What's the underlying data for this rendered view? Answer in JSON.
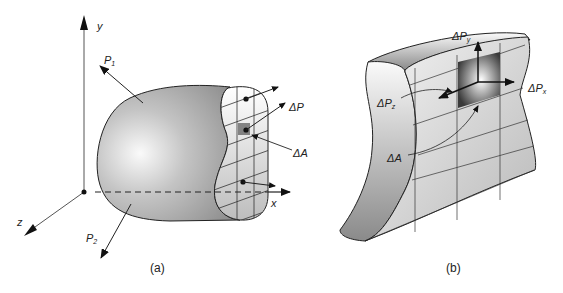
{
  "figure": {
    "panel_a": {
      "caption": "(a)",
      "labels": {
        "y_axis": "y",
        "x_axis": "x",
        "z_axis": "z",
        "force_1": "P",
        "force_1_sub": "1",
        "force_2": "P",
        "force_2_sub": "2",
        "delta_p": "ΔP",
        "delta_a": "ΔA"
      }
    },
    "panel_b": {
      "caption": "(b)",
      "labels": {
        "delta_py": "ΔP",
        "delta_py_sub": "y",
        "delta_px": "ΔP",
        "delta_px_sub": "x",
        "delta_pz": "ΔP",
        "delta_pz_sub": "z",
        "delta_a": "ΔA"
      }
    },
    "colors": {
      "body_dark": "#8a8a8a",
      "body_light": "#f2f2f2",
      "line": "#222222"
    }
  }
}
